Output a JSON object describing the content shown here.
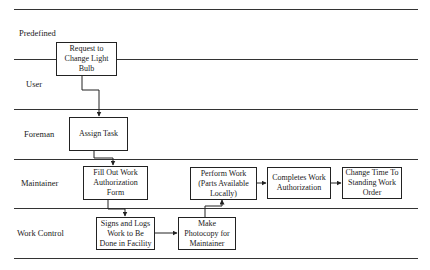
{
  "lanes": [
    {
      "label": "Predefined"
    },
    {
      "label": "User"
    },
    {
      "label": "Foreman"
    },
    {
      "label": "Maintainer"
    },
    {
      "label": "Work Control"
    }
  ],
  "boxes": {
    "request": "Request to Change Light Bulb",
    "assign": "Assign Task",
    "fill_out": "Fill Out Work Authorization Form",
    "signs_logs": "Signs and Logs Work to Be Done in Facility",
    "photocopy": "Make Photocopy for Maintainer",
    "perform": "Perform Work (Parts Available Locally)",
    "completes": "Completes Work Authorization",
    "change_time": "Change Time To Standing Work Order"
  }
}
